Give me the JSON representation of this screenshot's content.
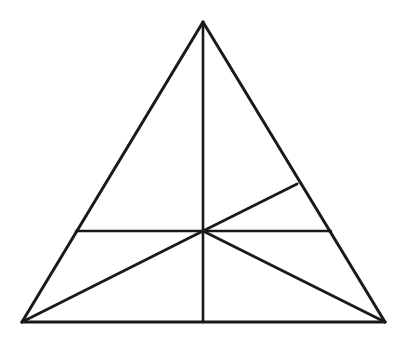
{
  "figure": {
    "background_color": "#ffffff",
    "stroke_color": "#1a1a1a",
    "canvas": {
      "width": 412,
      "height": 343
    },
    "points": {
      "apex": {
        "label": "A",
        "x": 203,
        "y": 22
      },
      "bottom_left": {
        "label": "B",
        "x": 22,
        "y": 322
      },
      "bottom_right": {
        "label": "C",
        "x": 385,
        "y": 322
      },
      "center_hub": {
        "label": "O",
        "x": 203,
        "y": 231
      },
      "left_edge_point": {
        "label": "D",
        "x": 76,
        "y": 231
      },
      "right_edge_point": {
        "label": "E",
        "x": 331,
        "y": 231
      },
      "right_edge_upper_point": {
        "label": "F",
        "x": 297,
        "y": 184
      },
      "base_midpoint": {
        "label": "M",
        "x": 203,
        "y": 322
      }
    },
    "segments": [
      {
        "name": "triangle-side-left",
        "from": "apex",
        "to": "bottom_left",
        "width": 3.0
      },
      {
        "name": "triangle-side-right",
        "from": "apex",
        "to": "bottom_right",
        "width": 3.0
      },
      {
        "name": "triangle-base",
        "from": "bottom_left",
        "to": "bottom_right",
        "width": 3.0
      },
      {
        "name": "vertical-median",
        "from": "apex",
        "to": "base_midpoint",
        "width": 2.6
      },
      {
        "name": "horizontal-transversal-left",
        "from": "left_edge_point",
        "to": "center_hub",
        "width": 2.4
      },
      {
        "name": "horizontal-transversal-right",
        "from": "center_hub",
        "to": "right_edge_point",
        "width": 2.4
      },
      {
        "name": "oblique-upper-right",
        "from": "center_hub",
        "to": "right_edge_upper_point",
        "width": 2.8
      },
      {
        "name": "cevian-to-bottom-left",
        "from": "center_hub",
        "to": "bottom_left",
        "width": 2.8
      },
      {
        "name": "cevian-to-bottom-right",
        "from": "center_hub",
        "to": "bottom_right",
        "width": 2.8
      }
    ]
  }
}
